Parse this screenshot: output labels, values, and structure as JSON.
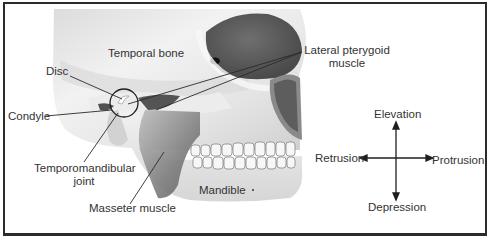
{
  "figure": {
    "colors": {
      "border": "#2b2b2b",
      "label_text": "#333333",
      "leader_line": "#2a2a2a",
      "bone_light": "#efefef",
      "bone_shadow": "#b9b9b9",
      "muscle": "#7a7a7a",
      "background": "#ffffff"
    }
  },
  "anatomy_labels": {
    "temporal_bone": "Temporal bone",
    "disc": "Disc",
    "condyle": "Condyle",
    "tmj_line1": "Temporomandibular",
    "tmj_line2": "joint",
    "masseter": "Masseter muscle",
    "mandible": "Mandible",
    "lateral_pterygoid_line1": "Lateral pterygoid",
    "lateral_pterygoid_line2": "muscle"
  },
  "movement_diagram": {
    "up": "Elevation",
    "down": "Depression",
    "left": "Retrusion",
    "right": "Protrusion"
  }
}
